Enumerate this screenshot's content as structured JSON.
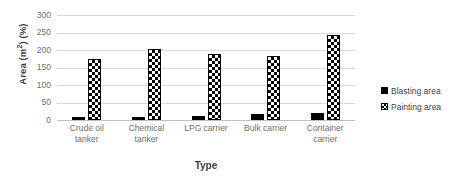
{
  "chart_data": {
    "type": "bar",
    "title": "",
    "xlabel": "Type",
    "ylabel": "Area (m²) (%)",
    "ylabel_main": "Area (m",
    "ylabel_sup": "2",
    "ylabel_tail": ") (%)",
    "categories": [
      "Crude oil tanker",
      "Chemical tanker",
      "LPG carrier",
      "Bulk carrier",
      "Container carrier"
    ],
    "category_lines": [
      [
        "Crude oil tanker"
      ],
      [
        "Chemical",
        "tanker"
      ],
      [
        "LPG carrier"
      ],
      [
        "Bulk carrier"
      ],
      [
        "Container",
        "carrier"
      ]
    ],
    "series": [
      {
        "name": "Blasting area",
        "values": [
          10,
          10,
          12,
          16,
          21
        ],
        "pattern": "solid-black",
        "color": "#000000"
      },
      {
        "name": "Painting area",
        "values": [
          173,
          202,
          189,
          183,
          243
        ],
        "pattern": "checkerboard",
        "color": "#000000"
      }
    ],
    "ylim": [
      0,
      300
    ],
    "yticks": [
      0,
      50,
      100,
      150,
      200,
      250,
      300
    ],
    "grid": true,
    "legend_position": "right"
  },
  "legend": {
    "items": [
      {
        "label": "Blasting area",
        "swatch": "solid-black-square-icon"
      },
      {
        "label": "Painting area",
        "swatch": "checkered-square-icon"
      }
    ]
  }
}
